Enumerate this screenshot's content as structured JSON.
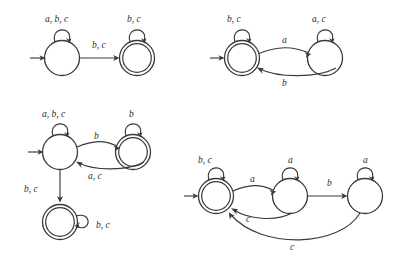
{
  "figure": {
    "kind": "finite-state-automata-collection",
    "count": 4,
    "alphabet": [
      "a",
      "b",
      "c"
    ]
  },
  "automata": [
    {
      "id": "top-left",
      "name": "automaton-1",
      "states": [
        {
          "id": "q0",
          "accepting": false,
          "start": true,
          "cx": 62,
          "cy": 58
        },
        {
          "id": "q1",
          "accepting": true,
          "start": false,
          "cx": 137,
          "cy": 58
        }
      ],
      "self_loops": [
        {
          "state": "q0",
          "label": "a, b, c",
          "label_x": 45,
          "label_y": 22
        },
        {
          "state": "q1",
          "label": "b, c",
          "label_x": 127,
          "label_y": 22
        }
      ],
      "transitions": [
        {
          "from": "q0",
          "to": "q1",
          "label": "b, c",
          "label_x": 92,
          "label_y": 48
        }
      ]
    },
    {
      "id": "top-right",
      "name": "automaton-2",
      "states": [
        {
          "id": "q0",
          "accepting": true,
          "start": true,
          "cx": 242,
          "cy": 58
        },
        {
          "id": "q1",
          "accepting": false,
          "start": false,
          "cx": 325,
          "cy": 58
        }
      ],
      "self_loops": [
        {
          "state": "q0",
          "label": "b, c",
          "label_x": 227,
          "label_y": 22
        },
        {
          "state": "q1",
          "label": "a, c",
          "label_x": 312,
          "label_y": 22
        }
      ],
      "transitions": [
        {
          "from": "q0",
          "to": "q1",
          "label": "a",
          "label_x": 282,
          "label_y": 43
        },
        {
          "from": "q1",
          "to": "q0",
          "label": "b",
          "label_x": 282,
          "label_y": 84
        }
      ]
    },
    {
      "id": "bottom-left",
      "name": "automaton-3",
      "states": [
        {
          "id": "q0",
          "accepting": false,
          "start": true,
          "cx": 60,
          "cy": 152
        },
        {
          "id": "q1",
          "accepting": true,
          "start": false,
          "cx": 133,
          "cy": 152
        },
        {
          "id": "q2",
          "accepting": true,
          "start": false,
          "cx": 60,
          "cy": 222
        }
      ],
      "self_loops": [
        {
          "state": "q0",
          "label": "a, b, c",
          "label_x": 42,
          "label_y": 117
        },
        {
          "state": "q1",
          "label": "b",
          "label_x": 129,
          "label_y": 117
        },
        {
          "state": "q2",
          "label": "b, c",
          "label_x": 96,
          "label_y": 228
        }
      ],
      "transitions": [
        {
          "from": "q0",
          "to": "q1",
          "label": "b",
          "label_x": 94,
          "label_y": 139
        },
        {
          "from": "q1",
          "to": "q0",
          "label": "a, c",
          "label_x": 88,
          "label_y": 177
        },
        {
          "from": "q0",
          "to": "q2",
          "label": "b, c",
          "label_x": 25,
          "label_y": 192
        }
      ]
    },
    {
      "id": "bottom-right",
      "name": "automaton-4",
      "states": [
        {
          "id": "q0",
          "accepting": true,
          "start": true,
          "cx": 216,
          "cy": 196
        },
        {
          "id": "q1",
          "accepting": false,
          "start": false,
          "cx": 290,
          "cy": 196
        },
        {
          "id": "q2",
          "accepting": false,
          "start": false,
          "cx": 365,
          "cy": 196
        }
      ],
      "self_loops": [
        {
          "state": "q0",
          "label": "b, c",
          "label_x": 199,
          "label_y": 163
        },
        {
          "state": "q1",
          "label": "a",
          "label_x": 288,
          "label_y": 163
        },
        {
          "state": "q2",
          "label": "a",
          "label_x": 363,
          "label_y": 163
        }
      ],
      "transitions": [
        {
          "from": "q0",
          "to": "q1",
          "label": "a",
          "label_x": 250,
          "label_y": 182
        },
        {
          "from": "q1",
          "to": "q0",
          "label": "c",
          "label_x": 248,
          "label_y": 220
        },
        {
          "from": "q1",
          "to": "q2",
          "label": "b",
          "label_x": 327,
          "label_y": 186
        },
        {
          "from": "q2",
          "to": "q0",
          "label": "c",
          "label_x": 292,
          "label_y": 250
        }
      ]
    }
  ],
  "style": {
    "ink_color": "#3a3a3a",
    "label_color": "#2b2b2b",
    "background": "#ffffff"
  }
}
